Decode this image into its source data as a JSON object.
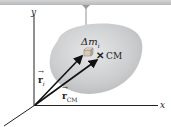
{
  "diagram": {
    "type": "physics-center-of-mass",
    "labels": {
      "y_axis": "y",
      "x_axis": "x",
      "mass_element": "Δm",
      "mass_subscript": "i",
      "cm": "CM",
      "r_i": "r",
      "r_i_subscript": "i",
      "r_cm": "r",
      "r_cm_subscript": "CM",
      "cm_marker": "✕"
    },
    "colors": {
      "ceiling": "#c8c9cb",
      "body": "#cfd0d2",
      "vectors": "#111111",
      "axes": "#222222",
      "string": "#777777"
    }
  }
}
